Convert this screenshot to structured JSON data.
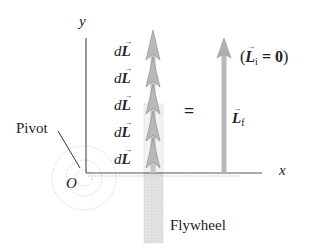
{
  "diagram": {
    "axes": {
      "x_label": "x",
      "y_label": "y",
      "origin_label": "O"
    },
    "pivot_label": "Pivot",
    "flywheel_label": "Flywheel",
    "increment_labels": [
      "dL",
      "dL",
      "dL",
      "dL",
      "dL"
    ],
    "increment_d": "d",
    "increment_vec": "L",
    "equals": "=",
    "final_vector": {
      "symbol": "L",
      "subscript": "f"
    },
    "initial_note": {
      "open": "(",
      "symbol": "L",
      "subscript": "i",
      "equals": " = ",
      "value": "0",
      "close": ")"
    },
    "colors": {
      "axis": "#555555",
      "arrow_fill": "#b8b8b8",
      "arrow_stroke": "#8a8a8a",
      "flywheel": "#dcdcdc",
      "text": "#222222"
    }
  }
}
